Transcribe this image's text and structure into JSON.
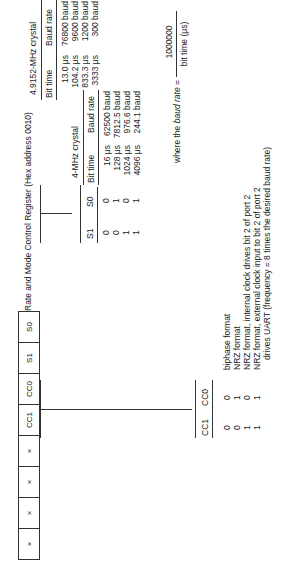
{
  "title": "Rate and Mode Control Register (Hex address 0010)",
  "register_bits": [
    "×",
    "×",
    "×",
    "×",
    "CC1",
    "CC0",
    "S1",
    "S0"
  ],
  "s_table": {
    "headers": [
      "S1",
      "S0"
    ],
    "rows": [
      [
        "0",
        "0"
      ],
      [
        "0",
        "1"
      ],
      [
        "1",
        "0"
      ],
      [
        "1",
        "1"
      ]
    ]
  },
  "crystal_4mhz": {
    "title": "4-MHz crystal",
    "headers": [
      "Bit time",
      "Baud rate"
    ],
    "rows": [
      [
        "16 μs",
        "62500 baud"
      ],
      [
        "128 μs",
        "7812.5 baud"
      ],
      [
        "1024 μs",
        "976.6 baud"
      ],
      [
        "4096 μs",
        "244.1 baud"
      ]
    ]
  },
  "crystal_49152mhz": {
    "title": "4.9152-MHz crystal",
    "headers": [
      "Bit time",
      "Baud rate"
    ],
    "rows": [
      [
        "13.0 μs",
        "76800 baud"
      ],
      [
        "104.2 μs",
        "9600 baud"
      ],
      [
        "833.3 μs",
        "1200 baud"
      ],
      [
        "3333 μs",
        "300 baud"
      ]
    ]
  },
  "formula": {
    "prefix": "where the",
    "term": "baud rate",
    "equals": "=",
    "numerator": "1000000",
    "denominator": "bit time (μs)"
  },
  "cc_table": {
    "headers": [
      "CC1",
      "CC0"
    ],
    "rows": [
      [
        "0",
        "0",
        "biphase format"
      ],
      [
        "0",
        "1",
        "NRZ format"
      ],
      [
        "1",
        "0",
        "NRZ format, internal clock drives bit 2 of port 2"
      ],
      [
        "1",
        "1",
        "NRZ format, external clock input to bit 2 of port 2"
      ]
    ],
    "continuation": "drives UART (frequency = 8 times the desired baud rate)"
  }
}
